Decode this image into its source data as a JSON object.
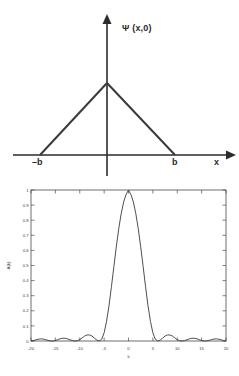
{
  "figure": {
    "panels": [
      "wavefunction-diagram",
      "amplitude-plot"
    ]
  },
  "top_diagram": {
    "name": "triangular-wavefunction-diagram",
    "vertical_axis_label": "Ψ (x,0)",
    "horizontal_axis_label": "x",
    "left_base_label": "–b",
    "right_base_label": "b",
    "shape": "triangle",
    "description": "Triangular wave packet peaked at x = 0, zero outside -b to b",
    "line_color": "#2b2b2b",
    "axis_color": "#2b2b2b"
  },
  "chart_data": {
    "type": "line",
    "title": "",
    "xlabel": "k",
    "ylabel": "A(k)",
    "xlim": [
      -20,
      20
    ],
    "ylim": [
      0,
      1
    ],
    "xticks": [
      -20,
      -15,
      -10,
      -5,
      0,
      5,
      10,
      15,
      20
    ],
    "xticklabels": [
      "-20",
      "-15",
      "-10",
      "-5",
      "0",
      "5",
      "10",
      "15",
      "20"
    ],
    "yticks": [
      0,
      0.1,
      0.2,
      0.3,
      0.4,
      0.5,
      0.6,
      0.7,
      0.8,
      0.9,
      1
    ],
    "yticklabels": [
      "0",
      "0.1",
      "0.2",
      "0.3",
      "0.4",
      "0.5",
      "0.6",
      "0.7",
      "0.8",
      "0.9",
      "1"
    ],
    "grid": false,
    "legend": null,
    "box": true,
    "line_color": "#3a3a3a",
    "series": [
      {
        "name": "A(k)",
        "function": "sinc squared: [sin(k*b/2)/(k*b/2)]^2 with first zeros at k = +/-6",
        "x": [
          -20,
          -19.5,
          -19,
          -18.5,
          -18,
          -17.5,
          -17,
          -16.5,
          -16,
          -15.5,
          -15,
          -14.5,
          -14,
          -13.5,
          -13,
          -12.5,
          -12,
          -11.5,
          -11,
          -10.5,
          -10,
          -9.5,
          -9,
          -8.5,
          -8,
          -7.5,
          -7,
          -6.5,
          -6,
          -5.5,
          -5,
          -4.5,
          -4,
          -3.5,
          -3,
          -2.5,
          -2,
          -1.5,
          -1,
          -0.5,
          0,
          0.5,
          1,
          1.5,
          2,
          2.5,
          3,
          3.5,
          4,
          4.5,
          5,
          5.5,
          6,
          6.5,
          7,
          7.5,
          8,
          8.5,
          9,
          9.5,
          10,
          10.5,
          11,
          11.5,
          12,
          12.5,
          13,
          13.5,
          14,
          14.5,
          15,
          15.5,
          16,
          16.5,
          17,
          17.5,
          18,
          18.5,
          19,
          19.5,
          20
        ],
        "y": [
          0.0,
          0.003,
          0.008,
          0.012,
          0.014,
          0.013,
          0.009,
          0.004,
          0.001,
          0.0,
          0.003,
          0.009,
          0.015,
          0.018,
          0.018,
          0.014,
          0.008,
          0.003,
          0.0,
          0.002,
          0.009,
          0.021,
          0.033,
          0.04,
          0.04,
          0.033,
          0.019,
          0.006,
          0.0,
          0.012,
          0.054,
          0.13,
          0.234,
          0.36,
          0.493,
          0.624,
          0.744,
          0.844,
          0.92,
          0.97,
          1.0,
          0.97,
          0.92,
          0.844,
          0.744,
          0.624,
          0.493,
          0.36,
          0.234,
          0.13,
          0.054,
          0.012,
          0.0,
          0.006,
          0.019,
          0.033,
          0.04,
          0.04,
          0.033,
          0.021,
          0.009,
          0.002,
          0.0,
          0.003,
          0.008,
          0.014,
          0.018,
          0.018,
          0.015,
          0.009,
          0.003,
          0.0,
          0.001,
          0.004,
          0.009,
          0.013,
          0.014,
          0.012,
          0.008,
          0.003,
          0.0
        ]
      }
    ]
  }
}
